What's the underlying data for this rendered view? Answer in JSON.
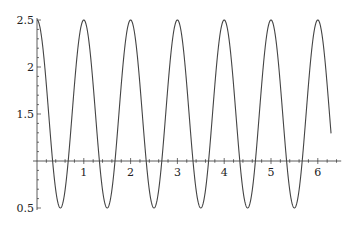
{
  "chart_data": {
    "type": "line",
    "title": "",
    "xlabel": "",
    "ylabel": "",
    "function": "1.5 + cos(2*pi*x)",
    "x_range": [
      0,
      6.283
    ],
    "xlim": [
      0,
      6.5
    ],
    "ylim": [
      0.5,
      2.5
    ],
    "axes_origin": {
      "x": 0,
      "y": 1
    },
    "x_ticks": [
      1,
      2,
      3,
      4,
      5,
      6
    ],
    "x_tick_labels": [
      "1",
      "2",
      "3",
      "4",
      "5",
      "6"
    ],
    "y_ticks": [
      0.5,
      1.5,
      2,
      2.5
    ],
    "y_tick_labels": [
      "0.5",
      "1.5",
      "2",
      "2.5"
    ],
    "grid": false,
    "legend": null,
    "series": [
      {
        "name": "f(x)",
        "color": "#444444",
        "peaks_x": [
          0,
          1,
          2,
          3,
          4,
          5,
          6
        ],
        "peak_y": 2.5,
        "troughs_x": [
          0.5,
          1.5,
          2.5,
          3.5,
          4.5,
          5.5
        ],
        "trough_y": 0.5
      }
    ]
  },
  "style": {
    "line_color": "#444444",
    "axis_color": "#333333"
  }
}
